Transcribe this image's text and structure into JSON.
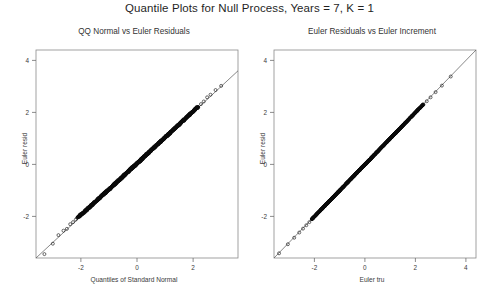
{
  "figure": {
    "title": "Quantile Plots for Null Process, Years = 7, K = 1",
    "background_color": "#ffffff",
    "foreground_color": "#2b2b2b"
  },
  "chart_data": [
    {
      "type": "scatter",
      "panel": "left",
      "title": "QQ Normal vs Euler Residuals",
      "xlabel": "Quantiles of Standard Normal",
      "ylabel": "Euler resid",
      "xlim": [
        -3.6,
        3.6
      ],
      "ylim": [
        -3.6,
        4.4
      ],
      "xticks": [
        -2,
        0,
        2
      ],
      "yticks": [
        -2,
        0,
        2,
        4
      ],
      "xticklabels": [
        "-2",
        "0",
        "2"
      ],
      "yticklabels": [
        "-2",
        "0",
        "2",
        "4"
      ],
      "grid": false,
      "legend": null,
      "marker": "open-circle",
      "reference_line": {
        "slope": 1.0,
        "intercept": 0.0,
        "style": "thin-solid"
      },
      "description": "Dense band of open circles lying along the 45-degree reference line; tails show a few isolated circles deviating slightly.",
      "x": [
        -3.3,
        -3.0,
        -2.8,
        -2.62,
        -2.5,
        -2.38,
        -2.28,
        -2.18,
        -2.1,
        -2.0,
        -1.9,
        -1.8,
        -1.7,
        -1.62,
        -1.54,
        -1.46,
        -1.38,
        -1.3,
        -1.22,
        -1.15,
        -1.08,
        -1.0,
        -0.93,
        -0.86,
        -0.79,
        -0.72,
        -0.65,
        -0.58,
        -0.51,
        -0.44,
        -0.37,
        -0.3,
        -0.24,
        -0.17,
        -0.1,
        -0.03,
        0.03,
        0.1,
        0.17,
        0.24,
        0.3,
        0.37,
        0.44,
        0.51,
        0.58,
        0.65,
        0.72,
        0.79,
        0.86,
        0.93,
        1.0,
        1.08,
        1.15,
        1.22,
        1.3,
        1.38,
        1.46,
        1.54,
        1.62,
        1.7,
        1.8,
        1.9,
        2.0,
        2.1,
        2.18,
        2.28,
        2.38,
        2.5,
        2.62,
        2.8,
        3.0,
        3.3
      ],
      "y": [
        -3.45,
        -3.05,
        -2.72,
        -2.55,
        -2.48,
        -2.3,
        -2.22,
        -2.12,
        -2.05,
        -1.96,
        -1.88,
        -1.78,
        -1.68,
        -1.6,
        -1.52,
        -1.44,
        -1.36,
        -1.28,
        -1.2,
        -1.13,
        -1.06,
        -0.99,
        -0.92,
        -0.85,
        -0.78,
        -0.71,
        -0.64,
        -0.57,
        -0.5,
        -0.43,
        -0.36,
        -0.29,
        -0.23,
        -0.16,
        -0.09,
        -0.02,
        0.04,
        0.11,
        0.18,
        0.25,
        0.31,
        0.38,
        0.45,
        0.52,
        0.59,
        0.66,
        0.73,
        0.8,
        0.87,
        0.94,
        1.01,
        1.09,
        1.16,
        1.23,
        1.31,
        1.39,
        1.47,
        1.55,
        1.63,
        1.71,
        1.81,
        1.91,
        2.01,
        2.12,
        2.2,
        2.32,
        2.42,
        2.58,
        2.68,
        2.86,
        3.02,
        3.38
      ]
    },
    {
      "type": "scatter",
      "panel": "right",
      "title": "Euler Residuals vs Euler Increment",
      "xlabel": "Euler tru",
      "ylabel": "Euler resid",
      "xlim": [
        -3.6,
        4.4
      ],
      "ylim": [
        -3.6,
        4.4
      ],
      "xticks": [
        -2,
        0,
        2,
        4
      ],
      "yticks": [
        -2,
        0,
        2,
        4
      ],
      "xticklabels": [
        "-2",
        "0",
        "2",
        "4"
      ],
      "yticklabels": [
        "-2",
        "0",
        "2",
        "4"
      ],
      "grid": false,
      "legend": null,
      "marker": "open-circle",
      "reference_line": {
        "slope": 1.0,
        "intercept": 0.0,
        "style": "thin-solid"
      },
      "description": "Very tight dense band of open circles essentially on the identity line; a few separated circles in the lower-left and upper-right tails.",
      "x": [
        -3.4,
        -3.05,
        -2.8,
        -2.6,
        -2.45,
        -2.32,
        -2.2,
        -2.1,
        -2.0,
        -1.9,
        -1.8,
        -1.7,
        -1.6,
        -1.52,
        -1.44,
        -1.36,
        -1.28,
        -1.2,
        -1.12,
        -1.05,
        -0.98,
        -0.91,
        -0.84,
        -0.77,
        -0.7,
        -0.63,
        -0.56,
        -0.49,
        -0.42,
        -0.35,
        -0.28,
        -0.21,
        -0.14,
        -0.07,
        0.0,
        0.07,
        0.14,
        0.21,
        0.28,
        0.35,
        0.42,
        0.49,
        0.56,
        0.63,
        0.7,
        0.77,
        0.84,
        0.91,
        0.98,
        1.05,
        1.12,
        1.2,
        1.28,
        1.36,
        1.44,
        1.52,
        1.6,
        1.7,
        1.8,
        1.9,
        2.0,
        2.1,
        2.2,
        2.32,
        2.45,
        2.6,
        2.8,
        3.05,
        3.4,
        3.8
      ],
      "y": [
        -3.42,
        -3.07,
        -2.82,
        -2.62,
        -2.47,
        -2.34,
        -2.22,
        -2.12,
        -2.02,
        -1.92,
        -1.82,
        -1.72,
        -1.62,
        -1.54,
        -1.46,
        -1.38,
        -1.3,
        -1.22,
        -1.14,
        -1.07,
        -1.0,
        -0.93,
        -0.86,
        -0.79,
        -0.72,
        -0.65,
        -0.58,
        -0.51,
        -0.44,
        -0.37,
        -0.3,
        -0.23,
        -0.16,
        -0.09,
        -0.02,
        0.05,
        0.12,
        0.19,
        0.26,
        0.33,
        0.4,
        0.47,
        0.54,
        0.61,
        0.68,
        0.75,
        0.82,
        0.89,
        0.96,
        1.03,
        1.1,
        1.18,
        1.26,
        1.34,
        1.42,
        1.5,
        1.58,
        1.68,
        1.78,
        1.88,
        1.98,
        2.08,
        2.18,
        2.3,
        2.43,
        2.58,
        2.78,
        3.03,
        3.38,
        3.78
      ]
    }
  ]
}
